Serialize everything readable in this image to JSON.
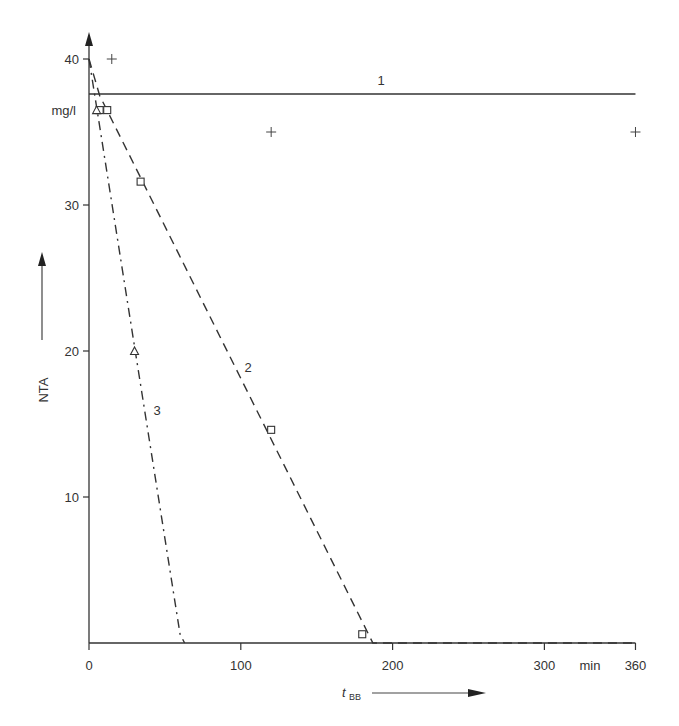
{
  "chart_data": {
    "type": "line",
    "title": "",
    "xlabel": "t_BB",
    "xlabel_main": "t",
    "xlabel_sub": "BB",
    "x_unit": "min",
    "ylabel": "NTA",
    "y_unit": "mg/l",
    "xlim": [
      0,
      360
    ],
    "ylim": [
      0,
      41
    ],
    "x_ticks": [
      0,
      100,
      200,
      300,
      360
    ],
    "x_tick_labels": [
      "0",
      "100",
      "200",
      "300",
      "360"
    ],
    "y_ticks": [
      10,
      20,
      30,
      40
    ],
    "y_tick_labels": [
      "10",
      "20",
      "30",
      "40"
    ],
    "grid": false,
    "legend": "none (curves labeled inline 1, 2, 3)",
    "series": [
      {
        "name": "1",
        "style": "solid",
        "marker": "plus",
        "line": [
          [
            0,
            37.6
          ],
          [
            360,
            37.6
          ]
        ],
        "points": [
          [
            15,
            40
          ],
          [
            120,
            35
          ],
          [
            360,
            35
          ]
        ]
      },
      {
        "name": "2",
        "style": "dashed",
        "marker": "square",
        "line": [
          [
            0,
            40
          ],
          [
            7,
            37.5
          ],
          [
            187,
            0
          ],
          [
            360,
            0
          ]
        ],
        "points": [
          [
            7,
            36.5
          ],
          [
            12,
            36.5
          ],
          [
            34,
            31.6
          ],
          [
            120,
            14.6
          ],
          [
            180,
            0.6
          ]
        ]
      },
      {
        "name": "3",
        "style": "dash-dot",
        "marker": "triangle",
        "line": [
          [
            0,
            40
          ],
          [
            60,
            0.6
          ],
          [
            63,
            0
          ]
        ],
        "points": [
          [
            5,
            36.5
          ],
          [
            30,
            20
          ]
        ]
      }
    ]
  },
  "labels": {
    "curve1": "1",
    "curve2": "2",
    "curve3": "3",
    "y_axis": "NTA",
    "y_unit": "mg/l",
    "x_unit": "min",
    "x_axis_main": "t",
    "x_axis_sub": "BB"
  }
}
